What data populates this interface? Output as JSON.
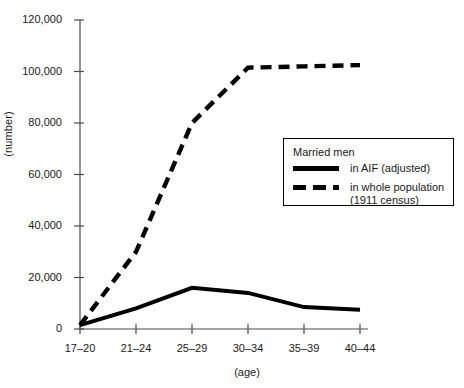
{
  "chart_data": {
    "type": "line",
    "title": "",
    "xlabel": "(age)",
    "ylabel": "(number)",
    "categories": [
      "17–20",
      "21–24",
      "25–29",
      "30–34",
      "35–39",
      "40–44"
    ],
    "ylim": [
      0,
      120000
    ],
    "yticks": [
      0,
      20000,
      40000,
      60000,
      80000,
      100000,
      120000
    ],
    "ytick_labels": [
      "0",
      "20,000",
      "40,000",
      "60,000",
      "80,000",
      "100,000",
      "120,000"
    ],
    "grid": false,
    "legend_position": "center-right",
    "series": [
      {
        "name": "in AIF (adjusted)",
        "style": "solid",
        "color": "#000000",
        "values": [
          1500,
          8000,
          16000,
          14000,
          8500,
          7500
        ]
      },
      {
        "name": "in whole population (1911 census)",
        "style": "dashed",
        "color": "#000000",
        "values": [
          1500,
          30000,
          80000,
          101500,
          102000,
          102500
        ]
      }
    ]
  },
  "legend": {
    "title": "Married men",
    "entries": [
      {
        "swatch": "solid-line-swatch",
        "label": "in AIF (adjusted)"
      },
      {
        "swatch": "dashed-line-swatch",
        "label_line1": "in whole population",
        "label_line2": "(1911 census)"
      }
    ]
  },
  "axes": {
    "y_axis_title": "(number)",
    "x_axis_title": "(age)"
  }
}
